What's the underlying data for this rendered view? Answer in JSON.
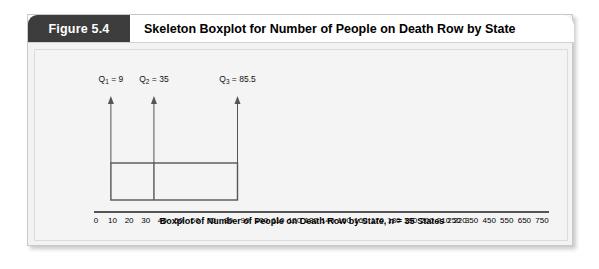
{
  "figure": {
    "tab_label": "Figure 5.4",
    "title": "Skeleton Boxplot for Number of People on Death Row by State"
  },
  "chart_data": {
    "type": "boxplot",
    "title": "Skeleton Boxplot for Number of People on Death Row by State",
    "xlabel": "Boxplot of Number of People on Death Row by State, n = 35 States",
    "ylabel": "",
    "grid": false,
    "legend": "none",
    "n": 35,
    "box": {
      "q1": 9,
      "median": 35,
      "q3": 85.5
    },
    "annotations": [
      {
        "text": "Q1 = 9",
        "label_main": "Q",
        "label_sub": "1",
        "label_value": "= 9",
        "value": 9
      },
      {
        "text": "Q2 = 35",
        "label_main": "Q",
        "label_sub": "2",
        "label_value": "= 35",
        "value": 35
      },
      {
        "text": "Q3 = 85.5",
        "label_main": "Q",
        "label_sub": "3",
        "label_value": "= 85.5",
        "value": 85.5
      }
    ],
    "axis_segments": [
      {
        "name": "lower-segment",
        "ticks": [
          0,
          10,
          20,
          30,
          40,
          50,
          60,
          70,
          80,
          90,
          100,
          110,
          120,
          130,
          140,
          150,
          160,
          170,
          180,
          190,
          200,
          210,
          220
        ],
        "range": [
          0,
          220
        ]
      },
      {
        "name": "upper-segment",
        "ticks": [
          250,
          350,
          450,
          550,
          650,
          750
        ],
        "range": [
          250,
          750
        ]
      }
    ],
    "axis_break": true,
    "arrows": [
      {
        "at": 9,
        "direction": "up"
      },
      {
        "at": 35,
        "direction": "up"
      },
      {
        "at": 85.5,
        "direction": "up"
      }
    ]
  },
  "axis_caption": {
    "text_before": "Boxplot of Number of People on Death Row by State, ",
    "italic": "n",
    "text_after": " = 35 States"
  },
  "colors": {
    "tab_background": "#3c3c3c",
    "tab_text": "#ffffff",
    "card_background": "#f3f3f3",
    "plot_background": "#f4f4f4",
    "ink": "#555555",
    "text": "#000000"
  }
}
